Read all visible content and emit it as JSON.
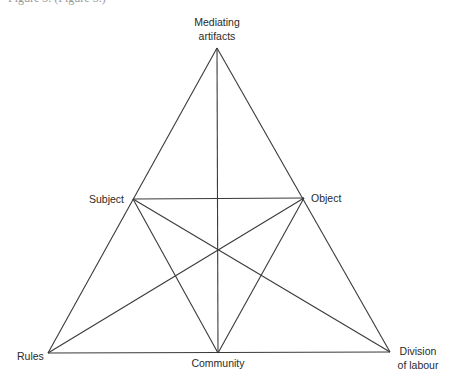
{
  "cropped_top_text": "Figure 3. (Figure 3.)",
  "diagram": {
    "nodes": {
      "mediating_artifacts": {
        "line1": "Mediating",
        "line2": "artifacts",
        "x": 217,
        "y": 48
      },
      "subject": {
        "label": "Subject",
        "x": 133,
        "y": 199
      },
      "object": {
        "label": "Object",
        "x": 304,
        "y": 199
      },
      "rules": {
        "label": "Rules",
        "x": 48,
        "y": 353
      },
      "community": {
        "label": "Community",
        "x": 218,
        "y": 353
      },
      "division_of_labour": {
        "line1": "Division",
        "line2": "of labour",
        "x": 390,
        "y": 352
      }
    },
    "edges": [
      [
        "mediating_artifacts",
        "rules"
      ],
      [
        "mediating_artifacts",
        "division_of_labour"
      ],
      [
        "rules",
        "division_of_labour"
      ],
      [
        "subject",
        "object"
      ],
      [
        "subject",
        "community"
      ],
      [
        "object",
        "community"
      ],
      [
        "subject",
        "division_of_labour"
      ],
      [
        "object",
        "rules"
      ],
      [
        "mediating_artifacts",
        "community"
      ]
    ],
    "line_color": "#3a3a3a"
  }
}
